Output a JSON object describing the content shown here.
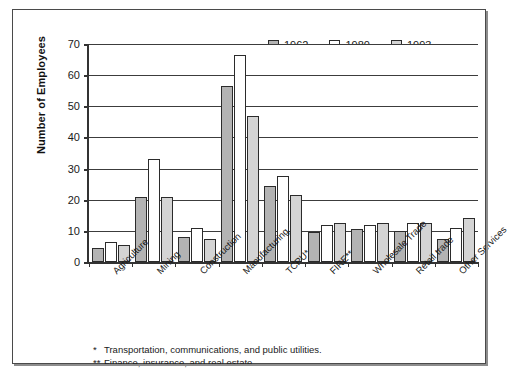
{
  "chart_data": {
    "type": "bar",
    "title": "",
    "xlabel": "",
    "ylabel": "Number of Employees",
    "ylim": [
      0,
      70
    ],
    "yticks": [
      0,
      10,
      20,
      30,
      40,
      50,
      60,
      70
    ],
    "grid": true,
    "legend_position": "top-right",
    "categories": [
      "Agriculture",
      "Mining",
      "Construction",
      "Manufacturing",
      "TCPU*",
      "FIRE**",
      "Wholesale Trade",
      "Retail trade",
      "Other Services"
    ],
    "series": [
      {
        "name": "1962",
        "color": "#b3b3b3",
        "values": [
          4.5,
          21,
          8,
          56.5,
          24.5,
          9.5,
          10.5,
          10,
          7.5
        ]
      },
      {
        "name": "1980",
        "color": "#ffffff",
        "values": [
          6.5,
          33,
          11,
          66.5,
          27.5,
          12,
          12,
          12.5,
          11
        ]
      },
      {
        "name": "1993",
        "color": "#d4d4d4",
        "values": [
          5.5,
          21,
          7.5,
          47,
          21.5,
          12.5,
          12.5,
          12.5,
          14
        ]
      }
    ],
    "annotations": [
      {
        "mark": "*",
        "text": "Transportation, communications, and public utilities."
      },
      {
        "mark": "**",
        "text": "Finance, insurance, and real estate."
      }
    ]
  }
}
